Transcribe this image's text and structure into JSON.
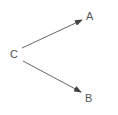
{
  "diagram": {
    "nodes": [
      {
        "id": "C",
        "label": "C",
        "x": 13,
        "y": 58
      },
      {
        "id": "A",
        "label": "A",
        "x": 90,
        "y": 20
      },
      {
        "id": "B",
        "label": "B",
        "x": 89,
        "y": 102
      }
    ],
    "edges": [
      {
        "from": "C",
        "to": "A"
      },
      {
        "from": "C",
        "to": "B"
      }
    ],
    "colors": {
      "line": "#555555",
      "text": "#555555"
    }
  }
}
